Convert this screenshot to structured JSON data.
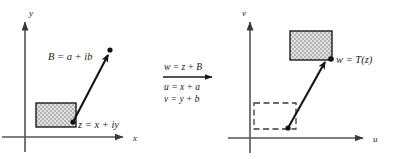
{
  "figure": {
    "background_color": "#ffffff",
    "ink_color": "#1a1a1a",
    "axis_color": "#4a4a4a",
    "shade_fill_color": "#c8c8c8",
    "shade_border_color": "#1a1a1a",
    "dashed_border_color": "#3a3a3a"
  },
  "left_plane": {
    "name": "z-plane",
    "axes": {
      "vertical_label": "y",
      "horizontal_label": "x"
    },
    "point_label": "z = x + iy",
    "vector_label": "B = a + ib",
    "region_style": "shaded",
    "geometry": {
      "origin": [
        25,
        137
      ],
      "y_axis_top": [
        25,
        18
      ],
      "x_axis_right": [
        128,
        137
      ],
      "x_axis_left": [
        2,
        137
      ],
      "y_axis_bottom": [
        25,
        152
      ],
      "vector_start": [
        73,
        122
      ],
      "vector_end": [
        110,
        51
      ],
      "rect": [
        36,
        103,
        40,
        24
      ]
    }
  },
  "middle_map": {
    "name": "transformation-equations",
    "above_arrow": "w = z + B",
    "below_arrow_line1": "u = x + a",
    "below_arrow_line2": "v = y + b",
    "arrow": {
      "from": [
        163,
        77
      ],
      "to": [
        215,
        77
      ]
    }
  },
  "right_plane": {
    "name": "w-plane",
    "axes": {
      "vertical_label": "v",
      "horizontal_label": "u"
    },
    "point_label": "w = T(z)",
    "region_shaded_style": "shaded",
    "region_dashed_style": "dashed-original",
    "geometry": {
      "origin": [
        250,
        138
      ],
      "v_axis_top": [
        250,
        18
      ],
      "u_axis_right": [
        368,
        138
      ],
      "u_axis_left": [
        228,
        138
      ],
      "v_axis_bottom": [
        250,
        153
      ],
      "vector_start": [
        288,
        128
      ],
      "vector_end": [
        327,
        58
      ],
      "shaded_rect": [
        290,
        31,
        42,
        29
      ],
      "dashed_rect": [
        254,
        103,
        42,
        26
      ]
    }
  }
}
